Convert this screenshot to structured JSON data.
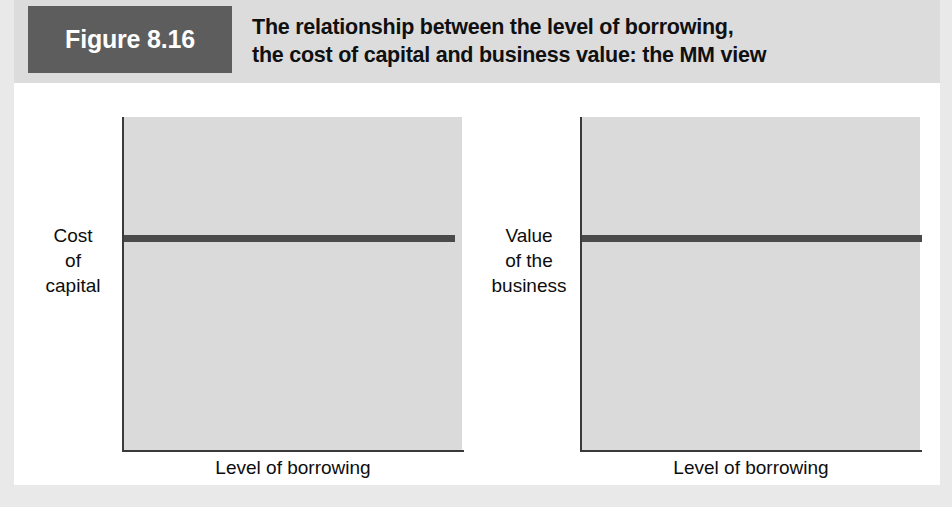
{
  "figure": {
    "tag": "Figure 8.16",
    "title_line1": "The relationship between the level of borrowing,",
    "title_line2": "the cost of capital and business value: the MM view",
    "tag_background": "#5d5d5d",
    "banner_background": "#dcdcdc"
  },
  "chart_data": [
    {
      "type": "line",
      "title": "Cost of capital versus level of borrowing (MM view)",
      "xlabel": "Level of borrowing",
      "ylabel": "Cost of capital",
      "ylabel_lines": [
        "Cost",
        "of",
        "capital"
      ],
      "xlabel_lines": [
        "Level of borrowing"
      ],
      "series": [
        {
          "name": "Cost of capital",
          "x": [
            0,
            100
          ],
          "values": [
            62,
            62
          ],
          "style": "flat horizontal line",
          "color": "#4a4a4a"
        }
      ],
      "xlim": [
        0,
        100
      ],
      "ylim": [
        0,
        100
      ],
      "tick_labels_x": [],
      "tick_labels_y": [],
      "grid": false,
      "legend": false,
      "plot_background": "#dadada",
      "axis_color": "#3a3a3a"
    },
    {
      "type": "line",
      "title": "Value of the business versus level of borrowing (MM view)",
      "xlabel": "Level of borrowing",
      "ylabel": "Value of the business",
      "ylabel_lines": [
        "Value",
        "of the",
        "business"
      ],
      "xlabel_lines": [
        "Level of borrowing"
      ],
      "series": [
        {
          "name": "Value of the business",
          "x": [
            0,
            100
          ],
          "values": [
            62,
            62
          ],
          "style": "flat horizontal line",
          "color": "#4a4a4a"
        }
      ],
      "xlim": [
        0,
        100
      ],
      "ylim": [
        0,
        100
      ],
      "tick_labels_x": [],
      "tick_labels_y": [],
      "grid": false,
      "legend": false,
      "plot_background": "#dadada",
      "axis_color": "#3a3a3a"
    }
  ]
}
